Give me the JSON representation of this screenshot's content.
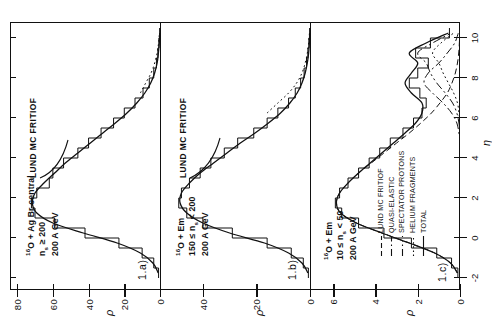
{
  "figure": {
    "axis": {
      "x_label": "η",
      "y_label": "ρ",
      "x_ticks": [
        -2,
        0,
        2,
        4,
        6,
        8,
        10
      ],
      "x_tick_labels": [
        "-2",
        "0",
        "2",
        "4",
        "6",
        "8",
        "10"
      ],
      "xlim": [
        -2.6,
        10.8
      ]
    }
  },
  "panels": [
    {
      "tag": "1.a)",
      "header_lines": [
        "16O + Ag Br central",
        "ns ≥ 200",
        "200 A GeV"
      ],
      "header_html": [
        "<span class='sup'>16</span>O + Ag Br central",
        "n<span class='sub'>s</span> ≥ 200",
        "200 A GeV"
      ],
      "curve_label": "LUND MC FRITIOF",
      "y_ticks": [
        0,
        20,
        40,
        60,
        80
      ],
      "y_tick_labels": [
        "0",
        "20",
        "40",
        "60",
        "80"
      ],
      "ylim": [
        0,
        84
      ]
    },
    {
      "tag": "1.b)",
      "header_lines": [
        "16O + Em",
        "150 ≤ ns < 200",
        "200 A GeV"
      ],
      "header_html": [
        "<span class='sup'>16</span>O + Em",
        "150 ≤ n<span class='sub'>s</span> < 200",
        "200 A GeV"
      ],
      "curve_label": "LUND MC FRITIOF",
      "y_ticks": [
        0,
        20,
        40
      ],
      "y_tick_labels": [
        "0",
        "20",
        "40"
      ],
      "ylim": [
        0,
        56
      ]
    },
    {
      "tag": "1.c)",
      "header_lines": [
        "16O + Em",
        "10 ≤ ns < 50",
        "200 A GeV"
      ],
      "header_html": [
        "<span class='sup'>16</span>O + Em",
        "10 ≤ n<span class='sub'>s</span> < 50",
        "200 A GeV"
      ],
      "curve_label": "",
      "y_ticks": [
        0,
        2,
        4,
        6
      ],
      "y_tick_labels": [
        "0",
        "2",
        "4",
        "6"
      ],
      "ylim": [
        0,
        7.1
      ],
      "legend": [
        {
          "label": "LUND MC FRITIOF",
          "style": "dashed"
        },
        {
          "label": "QUASI-ELASTIC",
          "style": "dashdot"
        },
        {
          "label": "SPECTATOR PROTONS",
          "style": "dashdotdot"
        },
        {
          "label": "HELIUM FRAGMENTS",
          "style": "dotted"
        },
        {
          "label": "TOTAL",
          "style": "solid"
        }
      ]
    }
  ],
  "chart_data": {
    "type": "line",
    "title": "",
    "xlabel": "η",
    "ylabel": "ρ",
    "xlim": [
      -2.6,
      10.8
    ],
    "grid": false,
    "legend_position": "upper-left-panel-c",
    "panels": [
      {
        "name": "1.a)",
        "ylim": [
          0,
          84
        ],
        "x": [
          -1.75,
          -1.25,
          -0.75,
          -0.25,
          0.25,
          0.75,
          1.25,
          1.75,
          2.25,
          2.75,
          3.25,
          3.75,
          4.25,
          4.75,
          5.25,
          5.75,
          6.25,
          6.75,
          7.25,
          7.75,
          8.25,
          8.75,
          9.25,
          9.75,
          10.25
        ],
        "series": [
          {
            "name": "data (histogram)",
            "style": "step-solid",
            "values": [
              0.8,
              3.5,
              10,
              23,
              42,
              59,
              70,
              72,
              69,
              62,
              60,
              54,
              46,
              40,
              33,
              26,
              20,
              14,
              9.5,
              6,
              3.5,
              2,
              1.2,
              0.6,
              0.2
            ]
          },
          {
            "name": "LUND MC FRITIOF",
            "style": "solid",
            "values": [
              1.0,
              4.0,
              11,
              24,
              43,
              60,
              69,
              71.5,
              70,
              65,
              59,
              53,
              46,
              39,
              32,
              25,
              18.5,
              13,
              8.5,
              5.2,
              3,
              1.6,
              0.9,
              0.4,
              0.15
            ]
          },
          {
            "name": "data tail (dotted)",
            "style": "dotted",
            "values": [
              null,
              null,
              null,
              null,
              null,
              null,
              null,
              null,
              null,
              null,
              null,
              null,
              null,
              null,
              null,
              null,
              null,
              null,
              11,
              8,
              5,
              3,
              1.6,
              0.8,
              0.3
            ]
          }
        ]
      },
      {
        "name": "1.b)",
        "ylim": [
          0,
          56
        ],
        "x": [
          -1.75,
          -1.25,
          -0.75,
          -0.25,
          0.25,
          0.75,
          1.25,
          1.75,
          2.25,
          2.75,
          3.25,
          3.75,
          4.25,
          4.75,
          5.25,
          5.75,
          6.25,
          6.75,
          7.25,
          7.75,
          8.25,
          8.75,
          9.25,
          9.75,
          10.25
        ],
        "series": [
          {
            "name": "data (histogram)",
            "style": "step-solid",
            "values": [
              0.6,
              2.5,
              7,
              16,
              29,
              40,
              46,
              49,
              48,
              45,
              41,
              37,
              32,
              27,
              21,
              16,
              12,
              8,
              5.5,
              3.5,
              2.2,
              1.3,
              0.8,
              0.4,
              0.15
            ]
          },
          {
            "name": "LUND MC FRITIOF",
            "style": "solid",
            "values": [
              0.8,
              3,
              8,
              17,
              30,
              40,
              46,
              48.5,
              48,
              45,
              41,
              36,
              31,
              26,
              20.5,
              15.5,
              11,
              7.5,
              4.8,
              3,
              1.8,
              1,
              0.5,
              0.25,
              0.1
            ]
          },
          {
            "name": "data tail (dotted)",
            "style": "dotted",
            "values": [
              null,
              null,
              null,
              null,
              null,
              null,
              null,
              null,
              null,
              null,
              null,
              null,
              null,
              null,
              null,
              null,
              16,
              12,
              8,
              5,
              3,
              1.8,
              1,
              0.5,
              0.2
            ]
          }
        ]
      },
      {
        "name": "1.c)",
        "ylim": [
          0,
          7.1
        ],
        "x": [
          -1.75,
          -1.25,
          -0.75,
          -0.25,
          0.25,
          0.75,
          1.25,
          1.75,
          2.25,
          2.75,
          3.25,
          3.75,
          4.25,
          4.75,
          5.25,
          5.75,
          6.25,
          6.75,
          7.25,
          7.75,
          8.25,
          8.75,
          9.25,
          9.75,
          10.25
        ],
        "series": [
          {
            "name": "TOTAL (data histogram)",
            "style": "step-solid",
            "values": [
              0.1,
              0.4,
              1.1,
              2.3,
              3.6,
              4.8,
              5.6,
              5.9,
              5.7,
              5.3,
              4.8,
              4.3,
              3.8,
              3.3,
              2.7,
              2.2,
              1.8,
              1.6,
              1.9,
              2.4,
              2.0,
              1.5,
              2.1,
              1.4,
              0.5
            ]
          },
          {
            "name": "LUND MC FRITIOF",
            "style": "dashed",
            "values": [
              0.12,
              0.45,
              1.2,
              2.4,
              3.7,
              4.9,
              5.65,
              5.85,
              5.7,
              5.3,
              4.8,
              4.2,
              3.6,
              3.0,
              2.4,
              1.85,
              1.35,
              0.95,
              0.6,
              0.38,
              0.22,
              0.12,
              0.06,
              0.03,
              0.01
            ]
          },
          {
            "name": "QUASI-ELASTIC",
            "style": "dashdot",
            "values": [
              0,
              0,
              0,
              0,
              0,
              0,
              0,
              0,
              0,
              0,
              0,
              0,
              0,
              0,
              0.05,
              0.15,
              0.4,
              0.8,
              1.3,
              1.7,
              1.5,
              1.0,
              0.6,
              0.25,
              0.08
            ]
          },
          {
            "name": "SPECTATOR PROTONS",
            "style": "dashdotdot",
            "values": [
              0,
              0,
              0,
              0,
              0,
              0,
              0,
              0,
              0,
              0,
              0,
              0,
              0,
              0,
              0,
              0.05,
              0.15,
              0.35,
              0.7,
              1.1,
              1.4,
              1.6,
              2.0,
              1.3,
              0.4
            ]
          },
          {
            "name": "HELIUM FRAGMENTS",
            "style": "dotted",
            "values": [
              0,
              0,
              0,
              0,
              0,
              0,
              0,
              0,
              0,
              0,
              0,
              0,
              0,
              0,
              0,
              0,
              0.05,
              0.12,
              0.3,
              0.55,
              0.8,
              1.0,
              1.3,
              0.9,
              0.3
            ]
          },
          {
            "name": "TOTAL (sum curve)",
            "style": "solid",
            "values": [
              0.12,
              0.45,
              1.2,
              2.4,
              3.7,
              4.9,
              5.65,
              5.85,
              5.7,
              5.3,
              4.8,
              4.25,
              3.7,
              3.15,
              2.6,
              2.1,
              1.8,
              1.8,
              2.3,
              2.6,
              2.3,
              2.0,
              2.4,
              1.6,
              0.55
            ]
          }
        ]
      }
    ]
  }
}
